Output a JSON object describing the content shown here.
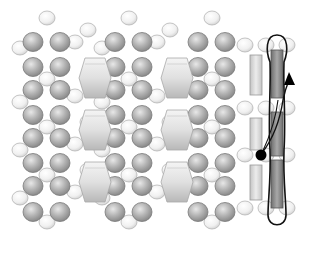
{
  "figure": {
    "colors": {
      "background": "#ffffff",
      "dark_atom_fill": "#b8b8b8",
      "dark_atom_stroke": "#7a7a7a",
      "light_atom_fill": "#f2f2f2",
      "light_atom_stroke": "#b5b5b5",
      "prism_fill": "#e2e2e2",
      "prism_stroke": "#a8a8a8",
      "light_rod_fill": "#d4d4d4",
      "dark_rod_fill": "#8c8c8c",
      "path_stroke": "#111111",
      "marker": "#000000"
    },
    "legend": [],
    "labels": []
  },
  "elements": {
    "dark_atom": "dark-atom",
    "light_atom": "light-atom",
    "prism": "hexagonal-prism",
    "light_rod": "light-rod",
    "dark_rod": "dark-rod",
    "loop_path": "diffusion-loop",
    "arrow": "diffusion-arrow",
    "start_marker": "start-dot"
  }
}
